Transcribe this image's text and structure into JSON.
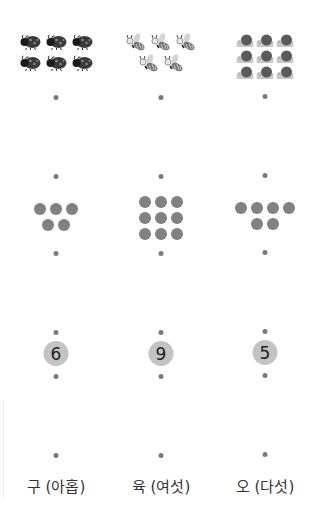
{
  "colors": {
    "dot": "#7a7a7a",
    "big_dot": "#808080",
    "number_circle": "#c3c3c3",
    "text": "#333333"
  },
  "columns": [
    {
      "picture": {
        "icon": "ladybug-icon",
        "count": 6,
        "rows": [
          3,
          3
        ]
      },
      "dots": {
        "count": 5,
        "rows": [
          3,
          2
        ]
      },
      "number": "6",
      "label": "구 (아홉)"
    },
    {
      "picture": {
        "icon": "bee-icon",
        "count": 5,
        "rows": [
          3,
          2
        ]
      },
      "dots": {
        "count": 9,
        "rows": [
          3,
          3,
          3
        ]
      },
      "number": "9",
      "label": "육 (여섯)"
    },
    {
      "picture": {
        "icon": "snail-icon",
        "count": 9,
        "rows": [
          3,
          3,
          3
        ]
      },
      "dots": {
        "count": 6,
        "rows": [
          4,
          2
        ]
      },
      "number": "5",
      "label": "오 (다섯)"
    }
  ]
}
